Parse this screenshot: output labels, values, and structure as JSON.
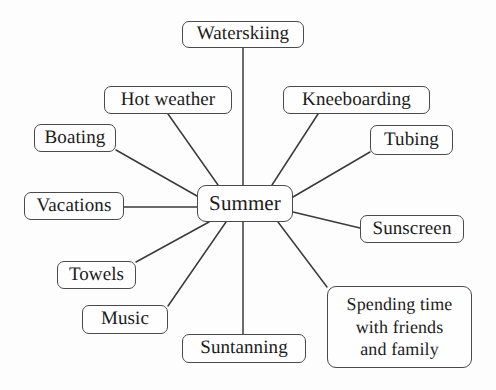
{
  "diagram": {
    "type": "mind-map",
    "title": "Summer",
    "background_color": "#fdfdfd",
    "node_border_color": "#4a4a4a",
    "node_fill_color": "#fefefe",
    "text_color": "#1b1b1b",
    "edge_color": "#3a3a3a",
    "center": {
      "id": "summer",
      "label": "Summer",
      "x": 197,
      "y": 185,
      "w": 96,
      "h": 37
    },
    "branches": [
      {
        "id": "waterskiing",
        "label": "Waterskiing",
        "x": 182,
        "y": 21,
        "w": 122,
        "h": 27,
        "edge": {
          "x1": 243,
          "y1": 48,
          "x2": 243,
          "y2": 185
        }
      },
      {
        "id": "hot-weather",
        "label": "Hot weather",
        "x": 104,
        "y": 86,
        "w": 128,
        "h": 28,
        "edge": {
          "x1": 168,
          "y1": 114,
          "x2": 218,
          "y2": 185
        }
      },
      {
        "id": "kneeboarding",
        "label": "Kneeboarding",
        "x": 283,
        "y": 86,
        "w": 147,
        "h": 28,
        "edge": {
          "x1": 318,
          "y1": 114,
          "x2": 272,
          "y2": 185
        }
      },
      {
        "id": "boating",
        "label": "Boating",
        "x": 34,
        "y": 124,
        "w": 82,
        "h": 28,
        "edge": {
          "x1": 116,
          "y1": 150,
          "x2": 197,
          "y2": 196
        }
      },
      {
        "id": "tubing",
        "label": "Tubing",
        "x": 370,
        "y": 125,
        "w": 83,
        "h": 30,
        "edge": {
          "x1": 370,
          "y1": 152,
          "x2": 293,
          "y2": 197
        }
      },
      {
        "id": "vacations",
        "label": "Vacations",
        "x": 24,
        "y": 192,
        "w": 100,
        "h": 28,
        "edge": {
          "x1": 124,
          "y1": 207,
          "x2": 197,
          "y2": 207
        }
      },
      {
        "id": "sunscreen",
        "label": "Sunscreen",
        "x": 360,
        "y": 215,
        "w": 104,
        "h": 28,
        "edge": {
          "x1": 360,
          "y1": 228,
          "x2": 293,
          "y2": 212
        }
      },
      {
        "id": "towels",
        "label": "Towels",
        "x": 57,
        "y": 261,
        "w": 79,
        "h": 28,
        "edge": {
          "x1": 136,
          "y1": 262,
          "x2": 209,
          "y2": 222
        }
      },
      {
        "id": "music",
        "label": "Music",
        "x": 82,
        "y": 305,
        "w": 86,
        "h": 29,
        "edge": {
          "x1": 168,
          "y1": 306,
          "x2": 226,
          "y2": 222
        }
      },
      {
        "id": "suntanning",
        "label": "Suntanning",
        "x": 182,
        "y": 334,
        "w": 124,
        "h": 29,
        "edge": {
          "x1": 243,
          "y1": 334,
          "x2": 243,
          "y2": 222
        }
      },
      {
        "id": "spending-time",
        "label": "Spending time\nwith friends\nand family",
        "x": 327,
        "y": 286,
        "w": 145,
        "h": 82,
        "edge": {
          "x1": 327,
          "y1": 287,
          "x2": 278,
          "y2": 222
        }
      }
    ]
  }
}
